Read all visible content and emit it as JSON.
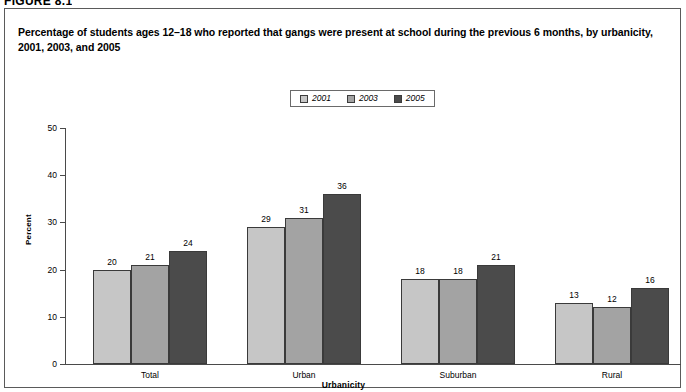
{
  "figure": {
    "header": "FIGURE 8.1",
    "title": "Percentage of students ages 12–18 who reported that gangs were present at school during the previous 6 months, by urbanicity, 2001, 2003, and 2005"
  },
  "colors": {
    "series_2001": "#c6c6c6",
    "series_2003": "#a3a3a3",
    "series_2005": "#4b4b4b",
    "axis": "#4a4a4a",
    "border": "#5a5a5a",
    "text": "#000000"
  },
  "chart_data": {
    "type": "bar",
    "title": "Percentage of students ages 12–18 who reported that gangs were present at school during the previous 6 months, by urbanicity, 2001, 2003, and 2005",
    "xlabel": "Urbanicity",
    "ylabel": "Percent",
    "categories": [
      "Total",
      "Urban",
      "Suburban",
      "Rural"
    ],
    "series": [
      {
        "name": "2001",
        "values": [
          20,
          29,
          18,
          13
        ],
        "color": "#c6c6c6"
      },
      {
        "name": "2003",
        "values": [
          21,
          31,
          18,
          12
        ],
        "color": "#a3a3a3"
      },
      {
        "name": "2005",
        "values": [
          24,
          36,
          21,
          16
        ],
        "color": "#4b4b4b"
      }
    ],
    "ylim": [
      0,
      50
    ],
    "yticks": [
      0,
      10,
      20,
      30,
      40,
      50
    ],
    "ytick_labels": [
      "0",
      "10",
      "20",
      "30",
      "40",
      "50"
    ],
    "grid": false,
    "legend_position": "top-center",
    "legend_entries": [
      "2001",
      "2003",
      "2005"
    ],
    "data_labels": true
  }
}
